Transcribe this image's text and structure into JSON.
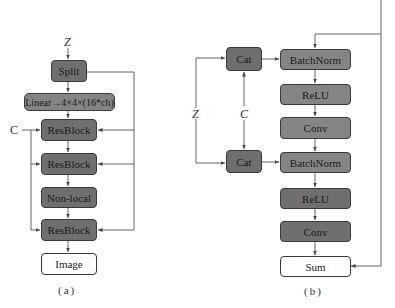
{
  "diagram_a": {
    "caption": "(a)",
    "input_z": "Z",
    "input_c": "C",
    "nodes": [
      {
        "id": "split",
        "label": "Split"
      },
      {
        "id": "linear",
        "label": "Linear→4×4×(16*ch)"
      },
      {
        "id": "resblock1",
        "label": "ResBlock"
      },
      {
        "id": "resblock2",
        "label": "ResBlock"
      },
      {
        "id": "nonlocal",
        "label": "Non-local"
      },
      {
        "id": "resblock3",
        "label": "ResBlock"
      },
      {
        "id": "image",
        "label": "Image"
      }
    ]
  },
  "diagram_b": {
    "caption": "(b)",
    "input_z": "Z",
    "input_c": "C",
    "nodes": [
      {
        "id": "cat1",
        "label": "Cat"
      },
      {
        "id": "cat2",
        "label": "Cat"
      },
      {
        "id": "batchnorm1",
        "label": "BatchNorm"
      },
      {
        "id": "relu1",
        "label": "ReLU"
      },
      {
        "id": "conv1",
        "label": "Conv"
      },
      {
        "id": "batchnorm2",
        "label": "BatchNorm"
      },
      {
        "id": "relu2",
        "label": "ReLU"
      },
      {
        "id": "conv2",
        "label": "Conv"
      },
      {
        "id": "sum",
        "label": "Sum"
      }
    ]
  },
  "colors": {
    "dark_box": "#6f6f6f",
    "mid_box": "#858585",
    "output_box": "#ffffff",
    "line": "#555555"
  }
}
